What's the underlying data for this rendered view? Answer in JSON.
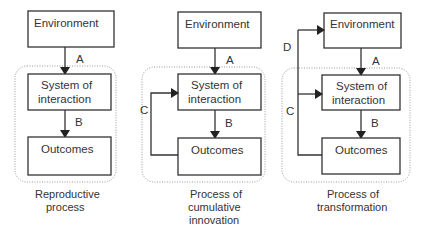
{
  "panels": [
    {
      "id": "reproductive",
      "environment": "Environment",
      "system": [
        "System of",
        "interaction"
      ],
      "outcomes": "Outcomes",
      "arrows": {
        "A": "A",
        "B": "B"
      },
      "caption": [
        "Reproductive",
        "process"
      ]
    },
    {
      "id": "cumulative",
      "environment": "Environment",
      "system": [
        "System of",
        "interaction"
      ],
      "outcomes": "Outcomes",
      "arrows": {
        "A": "A",
        "B": "B",
        "C": "C"
      },
      "caption": [
        "Process of",
        "cumulative",
        "innovation"
      ]
    },
    {
      "id": "transformation",
      "environment": "Environment",
      "system": [
        "System of",
        "interaction"
      ],
      "outcomes": "Outcomes",
      "arrows": {
        "A": "A",
        "B": "B",
        "C": "C",
        "D": "D"
      },
      "caption": [
        "Process of",
        "transformation"
      ]
    }
  ],
  "colors": {
    "line": "#333333",
    "dotted": "#999999"
  }
}
